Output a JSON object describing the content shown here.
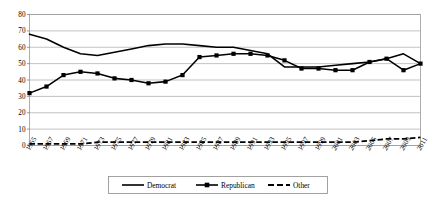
{
  "chart_data": {
    "type": "line",
    "title": "",
    "xlabel": "",
    "ylabel": "",
    "ylim": [
      0,
      80
    ],
    "ytick_step": 10,
    "yticks": [
      0,
      10,
      20,
      30,
      40,
      50,
      60,
      70,
      80
    ],
    "grid": true,
    "legend_position": "bottom",
    "categories": [
      "1965",
      "1967",
      "1969",
      "1971",
      "1973",
      "1975",
      "1977",
      "1979",
      "1981",
      "1983",
      "1985",
      "1987",
      "1989",
      "1991",
      "1993",
      "1995",
      "1997",
      "1999",
      "2001",
      "2003",
      "2005",
      "2007",
      "2009",
      "2011"
    ],
    "series": [
      {
        "name": "Democrat",
        "marker": "none",
        "line_style": "solid",
        "color": "#000000",
        "values": [
          68,
          65,
          60,
          56,
          55,
          57,
          59,
          61,
          62,
          62,
          61,
          60,
          60,
          58,
          56,
          48,
          48,
          48,
          49,
          50,
          51,
          53,
          56,
          50
        ]
      },
      {
        "name": "Republican",
        "marker": "square",
        "line_style": "solid",
        "color": "#000000",
        "values": [
          32,
          36,
          43,
          45,
          44,
          41,
          40,
          38,
          39,
          43,
          54,
          55,
          56,
          56,
          55,
          52,
          47,
          47,
          46,
          46,
          51,
          53,
          46,
          50
        ]
      },
      {
        "name": "Other",
        "marker": "none",
        "line_style": "dashed",
        "color": "#000000",
        "values": [
          1,
          1,
          1,
          1,
          2,
          2,
          2,
          2,
          2,
          2,
          2,
          2,
          2,
          2,
          2,
          2,
          2,
          2,
          2,
          2,
          3,
          4,
          4,
          5
        ]
      }
    ],
    "legend": [
      {
        "label": "Democrat",
        "style": "solid-line"
      },
      {
        "label": "Republican",
        "style": "solid-line-square-marker"
      },
      {
        "label": "Other",
        "style": "dashed-line"
      }
    ]
  }
}
